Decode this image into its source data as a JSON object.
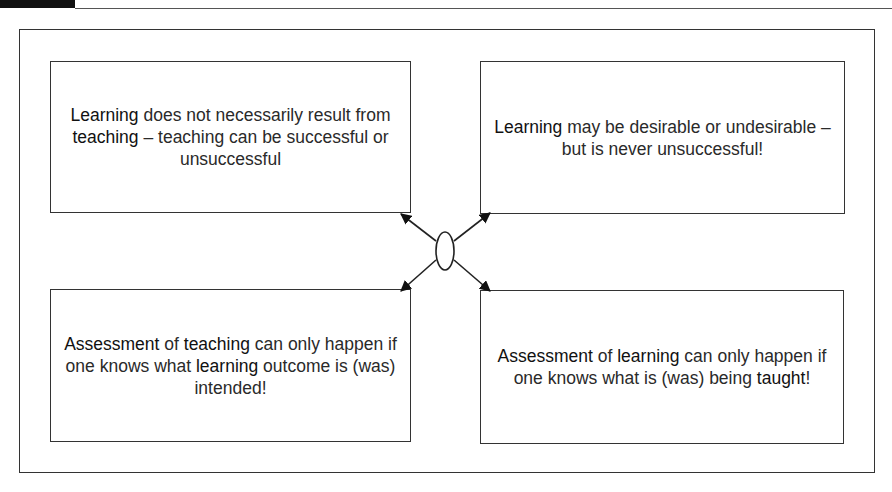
{
  "figure": {
    "header_tab_color": "#111111",
    "boxes": {
      "top_left": {
        "segments": [
          {
            "text": "Learning",
            "em": true
          },
          {
            "text": " does not necessarily result from ",
            "em": false
          },
          {
            "text": "teaching",
            "em": true
          },
          {
            "text": " – teaching can be successful or unsuccessful",
            "em": false
          }
        ]
      },
      "top_right": {
        "segments": [
          {
            "text": "Learning",
            "em": true
          },
          {
            "text": " may be desirable or undesirable – but is never unsuccessful!",
            "em": false
          }
        ]
      },
      "bottom_left": {
        "segments": [
          {
            "text": "Assessment",
            "em": true
          },
          {
            "text": " of ",
            "em": false
          },
          {
            "text": "teaching",
            "em": true
          },
          {
            "text": " can only happen if one knows what ",
            "em": false
          },
          {
            "text": "learning",
            "em": true
          },
          {
            "text": " outcome is (was) intended!",
            "em": false
          }
        ]
      },
      "bottom_right": {
        "segments": [
          {
            "text": "Assessment",
            "em": true
          },
          {
            "text": " of ",
            "em": false
          },
          {
            "text": "learning",
            "em": true
          },
          {
            "text": " can only happen if one knows what is (was) being ",
            "em": false
          },
          {
            "text": "taught",
            "em": true
          },
          {
            "text": "!",
            "em": false
          }
        ]
      }
    },
    "center_node": {
      "shape": "ellipse",
      "label": ""
    },
    "connectors": [
      "center-to-top-left",
      "center-to-top-right",
      "center-to-bottom-left",
      "center-to-bottom-right"
    ]
  }
}
